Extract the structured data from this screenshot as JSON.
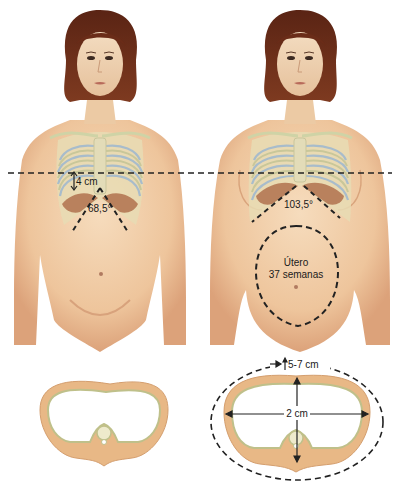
{
  "figure": {
    "panels": [
      {
        "id": "non-pregnant",
        "rib_height_label": "4 cm",
        "subcostal_angle_label": "68,5°"
      },
      {
        "id": "pregnant",
        "subcostal_angle_label": "103,5°",
        "uterus_label_line1": "Útero",
        "uterus_label_line2": "37 semanas"
      }
    ],
    "cross_sections": {
      "non_pregnant": {},
      "pregnant": {
        "circumference_increase_label": "5-7 cm",
        "transverse_diameter_label": "2 cm"
      }
    }
  },
  "colors": {
    "skin": "#efc9a2",
    "skin_shadow": "#d9a47c",
    "hair": "#6a2c18",
    "rib": "#cfd3a6",
    "rib_blue": "#a8bccb",
    "costal_cartilage": "#b0714e",
    "bone_ring": "#e8b886",
    "dash": "#222222"
  }
}
